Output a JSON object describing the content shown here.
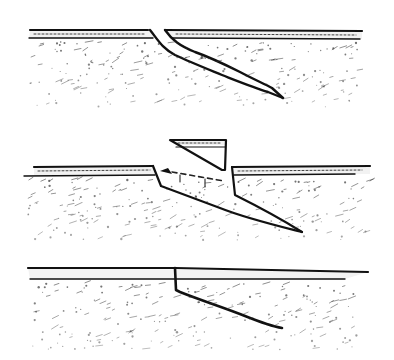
{
  "figure": {
    "background": "#ffffff",
    "ink_color": "#111111",
    "panels": [
      {
        "id": "top",
        "name": "oblique-crack",
        "surface_y": 30,
        "layer_thickness": 8,
        "left_layer": [
          29,
          148
        ],
        "right_layer": [
          165,
          362
        ],
        "crack_tip": [
          283,
          97
        ]
      },
      {
        "id": "middle",
        "name": "lifted-wedge",
        "surface_y": 168,
        "layer_thickness": 8,
        "left_layer": [
          34,
          153
        ],
        "right_layer": [
          232,
          370
        ],
        "wedge_top": [
          [
            170,
            140
          ],
          [
            226,
            140
          ]
        ],
        "wedge_tip": [
          222,
          170
        ],
        "cavity_tip": [
          302,
          232
        ],
        "dashed_line": true
      },
      {
        "id": "bottom",
        "name": "vertical-then-oblique-crack",
        "surface_y": 268,
        "layer_thickness": 10,
        "left_layer": [
          28,
          175
        ],
        "right_layer": [
          175,
          368
        ],
        "crack_tip": [
          282,
          328
        ]
      }
    ]
  }
}
